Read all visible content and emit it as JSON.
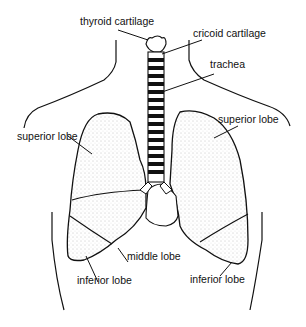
{
  "diagram": {
    "labels": {
      "thyroid_cartilage": "thyroid cartilage",
      "cricoid_cartilage": "cricoid cartilage",
      "trachea": "trachea",
      "superior_lobe_right": "superior lobe",
      "superior_lobe_left": "superior lobe",
      "middle_lobe": "middle lobe",
      "inferior_lobe_right": "inferior lobe",
      "inferior_lobe_left": "inferior lobe"
    },
    "colors": {
      "ink": "#111111",
      "background": "#ffffff",
      "stipple": "#9a9a9a"
    }
  }
}
